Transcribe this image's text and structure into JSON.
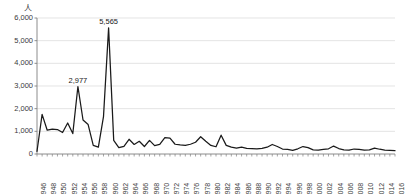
{
  "chart_data": {
    "type": "line",
    "title": "",
    "subtitle": "",
    "xlabel": "",
    "ylabel": "",
    "unit_label": "人",
    "ylim": [
      0,
      6000
    ],
    "ytick_labels": [
      "0",
      "1,000",
      "2,000",
      "3,000",
      "4,000",
      "5,000",
      "6,000"
    ],
    "ytick_values": [
      0,
      1000,
      2000,
      3000,
      4000,
      5000,
      6000
    ],
    "grid": true,
    "grid_axis": "y",
    "legend": false,
    "legend_position": "none",
    "line_color": "#1a1a1a",
    "grid_color": "#d9d9d9",
    "axis_color": "#808080",
    "xtick_labels": [
      "1946",
      "1948",
      "1950",
      "1952",
      "1954",
      "1956",
      "1958",
      "1960",
      "1962",
      "1964",
      "1966",
      "1968",
      "1970",
      "1972",
      "1974",
      "1976",
      "1978",
      "1980",
      "1982",
      "1984",
      "1986",
      "1988",
      "1990",
      "1992",
      "1994",
      "1996",
      "1998",
      "2000",
      "2002",
      "2004",
      "2006",
      "2008",
      "2010",
      "2012",
      "2014",
      "2016"
    ],
    "x": [
      1946,
      1947,
      1948,
      1949,
      1950,
      1951,
      1952,
      1953,
      1954,
      1955,
      1956,
      1957,
      1958,
      1959,
      1960,
      1961,
      1962,
      1963,
      1964,
      1965,
      1966,
      1967,
      1968,
      1969,
      1970,
      1971,
      1972,
      1973,
      1974,
      1975,
      1976,
      1977,
      1978,
      1979,
      1980,
      1981,
      1982,
      1983,
      1984,
      1985,
      1986,
      1987,
      1988,
      1989,
      1990,
      1991,
      1992,
      1993,
      1994,
      1995,
      1996,
      1997,
      1998,
      1999,
      2000,
      2001,
      2002,
      2003,
      2004,
      2005,
      2006,
      2007,
      2008,
      2009,
      2010,
      2011,
      2012,
      2013,
      2014,
      2015,
      2016
    ],
    "values": [
      120,
      1750,
      1050,
      1100,
      1080,
      950,
      1370,
      900,
      2977,
      1500,
      1300,
      380,
      300,
      1650,
      5565,
      600,
      280,
      340,
      650,
      420,
      560,
      330,
      600,
      370,
      420,
      720,
      700,
      430,
      400,
      380,
      430,
      520,
      760,
      560,
      380,
      320,
      830,
      380,
      300,
      260,
      300,
      250,
      240,
      230,
      250,
      300,
      420,
      330,
      220,
      200,
      160,
      230,
      330,
      280,
      180,
      170,
      200,
      230,
      350,
      240,
      180,
      170,
      220,
      200,
      170,
      180,
      260,
      210,
      170,
      160,
      150
    ],
    "annotations": [
      {
        "label": "2,977",
        "x": 1954,
        "y": 2977
      },
      {
        "label": "5,565",
        "x": 1960,
        "y": 5565
      }
    ]
  }
}
